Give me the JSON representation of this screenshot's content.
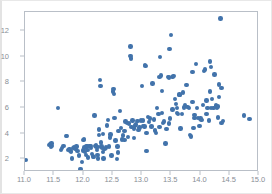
{
  "chart_data": {
    "type": "scatter",
    "title": "",
    "xlabel": "",
    "ylabel": "",
    "xlim": [
      11.0,
      15.0
    ],
    "ylim": [
      1.0,
      13.5
    ],
    "xticks": [
      11.0,
      11.5,
      12.0,
      12.5,
      13.0,
      13.5,
      14.0,
      14.5,
      15.0
    ],
    "xtick_labels": [
      "11.0",
      "11.5",
      "12.0",
      "12.5",
      "13.0",
      "13.5",
      "14.0",
      "14.5",
      "15.0"
    ],
    "yticks": [
      2,
      4,
      6,
      8,
      10,
      12
    ],
    "ytick_labels": [
      "2",
      "4",
      "6",
      "8",
      "10",
      "12"
    ],
    "grid": false,
    "legend": null,
    "marker_color": "#4273ab",
    "marker_size": 4.4,
    "series": [
      {
        "name": "points",
        "x": [
          11.02,
          11.56,
          11.41,
          11.43,
          11.44,
          11.46,
          11.45,
          11.62,
          11.66,
          11.63,
          11.7,
          11.72,
          11.74,
          11.76,
          11.78,
          11.8,
          11.79,
          11.82,
          11.84,
          11.86,
          11.88,
          11.9,
          11.92,
          11.95,
          11.97,
          11.99,
          12.0,
          12.01,
          12.02,
          12.03,
          12.04,
          12.05,
          12.06,
          12.07,
          12.08,
          12.1,
          12.12,
          12.13,
          12.14,
          12.16,
          12.18,
          12.19,
          12.2,
          12.21,
          12.22,
          12.23,
          12.24,
          12.25,
          12.26,
          12.27,
          12.28,
          12.29,
          12.3,
          12.31,
          12.32,
          12.33,
          12.34,
          12.36,
          12.38,
          12.4,
          12.42,
          12.44,
          12.46,
          12.48,
          12.5,
          12.51,
          12.52,
          12.53,
          12.55,
          12.57,
          12.59,
          12.6,
          12.62,
          12.64,
          12.66,
          12.68,
          12.7,
          12.72,
          12.74,
          12.76,
          12.78,
          12.8,
          12.8,
          12.81,
          12.82,
          12.84,
          12.86,
          12.88,
          12.9,
          12.92,
          12.94,
          12.96,
          12.98,
          13.0,
          13.02,
          13.04,
          13.05,
          13.06,
          13.08,
          13.1,
          13.12,
          13.14,
          13.16,
          13.18,
          13.2,
          13.22,
          13.24,
          13.26,
          13.28,
          13.3,
          13.31,
          13.32,
          13.34,
          13.36,
          13.38,
          13.4,
          13.42,
          13.44,
          13.46,
          13.47,
          13.48,
          13.5,
          13.52,
          13.54,
          13.56,
          13.58,
          13.6,
          13.62,
          13.64,
          13.66,
          13.68,
          13.7,
          13.72,
          13.74,
          13.76,
          13.78,
          13.8,
          13.82,
          13.84,
          13.86,
          13.88,
          13.9,
          13.92,
          13.94,
          13.96,
          13.98,
          14.0,
          14.02,
          14.04,
          14.06,
          14.08,
          14.1,
          14.12,
          14.14,
          14.16,
          14.18,
          14.2,
          14.22,
          14.24,
          14.26,
          14.28,
          14.3,
          14.32,
          14.34,
          14.36,
          14.38,
          14.74,
          14.84,
          12.33,
          12.58,
          12.7,
          12.86,
          13.02,
          13.34,
          13.46,
          13.52,
          13.64,
          13.9,
          14.1,
          14.16,
          14.3,
          14.36,
          12.25,
          12.45,
          13.08,
          13.3,
          13.6,
          13.86,
          14.18,
          14.32
        ],
        "y": [
          1.93,
          6.02,
          3.12,
          3.18,
          2.95,
          3.05,
          3.22,
          2.72,
          3.02,
          2.88,
          3.82,
          3.8,
          2.72,
          2.8,
          2.62,
          2.05,
          2.55,
          2.88,
          2.9,
          2.78,
          3.0,
          2.62,
          2.3,
          1.22,
          1.78,
          2.68,
          3.52,
          3.58,
          2.92,
          2.58,
          2.35,
          2.98,
          3.02,
          2.7,
          2.12,
          3.02,
          3.05,
          2.88,
          2.4,
          2.2,
          2.18,
          5.42,
          3.02,
          3.08,
          2.95,
          2.72,
          2.32,
          2.06,
          4.32,
          3.9,
          8.18,
          7.72,
          3.32,
          3.0,
          2.88,
          2.55,
          2.05,
          2.82,
          2.9,
          4.62,
          5.05,
          2.98,
          3.92,
          2.3,
          7.28,
          7.5,
          7.1,
          5.2,
          3.45,
          2.02,
          2.52,
          4.22,
          5.78,
          4.45,
          3.55,
          3.85,
          4.22,
          4.95,
          4.82,
          3.75,
          4.78,
          10.82,
          10.08,
          9.88,
          4.52,
          5.02,
          4.4,
          4.62,
          4.72,
          5.0,
          4.3,
          4.48,
          5.02,
          7.72,
          4.6,
          4.55,
          9.38,
          9.3,
          2.62,
          5.3,
          4.92,
          5.18,
          4.55,
          7.92,
          5.1,
          4.25,
          4.05,
          6.0,
          5.55,
          8.4,
          10.0,
          8.55,
          7.32,
          4.82,
          4.95,
          3.22,
          4.38,
          8.42,
          8.38,
          10.6,
          5.18,
          11.68,
          8.4,
          8.52,
          6.7,
          6.3,
          5.98,
          5.55,
          7.02,
          4.4,
          5.52,
          7.22,
          6.05,
          6.22,
          7.8,
          6.08,
          5.98,
          3.88,
          3.78,
          8.82,
          4.45,
          5.45,
          9.45,
          6.02,
          5.22,
          4.6,
          5.18,
          5.05,
          6.25,
          8.88,
          9.02,
          5.52,
          6.02,
          5.02,
          9.62,
          9.2,
          6.7,
          5.98,
          8.62,
          6.2,
          5.98,
          5.25,
          7.85,
          13.0,
          7.55,
          5.0,
          5.4,
          5.12,
          3.98,
          2.98,
          3.52,
          3.68,
          5.02,
          5.62,
          4.78,
          5.88,
          7.05,
          5.2,
          6.58,
          7.28,
          6.12,
          4.85,
          2.95,
          3.7,
          4.05,
          4.5,
          5.62,
          6.48,
          6.02,
          6.85
        ]
      }
    ]
  }
}
